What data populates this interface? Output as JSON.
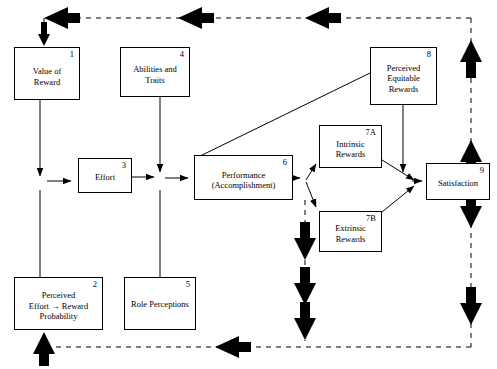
{
  "diagram": {
    "type": "flow-diagram",
    "width": 497,
    "height": 369,
    "line_color": "#000000",
    "background": "#ffffff",
    "boxes": [
      {
        "id": "1",
        "number": "1",
        "label": "Value of\nReward",
        "line1": "Value of",
        "line2": "Reward",
        "line3": "",
        "x": 14,
        "y": 47,
        "w": 66,
        "h": 53
      },
      {
        "id": "4",
        "number": "4",
        "label": "Abilities and\nTraits",
        "line1": "Abilities and",
        "line2": "Traits",
        "line3": "",
        "x": 120,
        "y": 47,
        "w": 70,
        "h": 50
      },
      {
        "id": "8",
        "number": "8",
        "label": "Perceived\nEquitable\nRewards",
        "line1": "Perceived",
        "line2": "Equitable",
        "line3": "Rewards",
        "x": 370,
        "y": 47,
        "w": 67,
        "h": 58
      },
      {
        "id": "3",
        "number": "3",
        "label": "Effort",
        "line1": "Effort",
        "line2": "",
        "line3": "",
        "x": 78,
        "y": 158,
        "w": 54,
        "h": 35
      },
      {
        "id": "6",
        "number": "6",
        "label": "Performance\n(Accomplishment)",
        "line1": "Performance",
        "line2": "(Accomplishment)",
        "line3": "",
        "x": 194,
        "y": 155,
        "w": 99,
        "h": 45
      },
      {
        "id": "7A",
        "number": "7A",
        "label": "Intrinsic\nRewards",
        "line1": "Intrinsic",
        "line2": "Rewards",
        "line3": "",
        "x": 319,
        "y": 125,
        "w": 63,
        "h": 43
      },
      {
        "id": "7B",
        "number": "7B",
        "label": "Extrinsic\nRewards",
        "line1": "Extrinsic",
        "line2": "Rewards",
        "line3": "",
        "x": 319,
        "y": 211,
        "w": 63,
        "h": 41
      },
      {
        "id": "9",
        "number": "9",
        "label": "Satisfaction",
        "line1": "Satisfaction",
        "line2": "",
        "line3": "",
        "x": 426,
        "y": 163,
        "w": 64,
        "h": 37
      },
      {
        "id": "2",
        "number": "2",
        "label": "Perceived\nEffort → Reward\nProbability",
        "line1": "Perceived",
        "line2": "Effort → Reward",
        "line3": "Probability",
        "x": 14,
        "y": 277,
        "w": 89,
        "h": 53
      },
      {
        "id": "5",
        "number": "5",
        "label": "Role Perceptions",
        "line1": "Role Perceptions",
        "line2": "",
        "line3": "",
        "x": 124,
        "y": 277,
        "w": 72,
        "h": 53
      }
    ],
    "connections": [
      {
        "from": "1",
        "to": "3",
        "style": "solid",
        "desc": "value-of-reward-to-effort"
      },
      {
        "from": "2",
        "to": "3",
        "style": "solid",
        "desc": "perceived-probability-to-effort"
      },
      {
        "from": "3",
        "to": "6",
        "style": "solid",
        "desc": "effort-to-performance"
      },
      {
        "from": "4",
        "to": "6",
        "style": "solid",
        "desc": "abilities-to-performance"
      },
      {
        "from": "5",
        "to": "6",
        "style": "solid",
        "desc": "role-perceptions-to-performance"
      },
      {
        "from": "6",
        "to": "7A",
        "style": "solid",
        "desc": "performance-to-intrinsic-rewards"
      },
      {
        "from": "6",
        "to": "7B",
        "style": "solid",
        "desc": "performance-to-extrinsic-rewards"
      },
      {
        "from": "7A",
        "to": "9",
        "style": "solid",
        "desc": "intrinsic-rewards-to-satisfaction"
      },
      {
        "from": "7B",
        "to": "9",
        "style": "solid",
        "desc": "extrinsic-rewards-to-satisfaction"
      },
      {
        "from": "8",
        "to": "9",
        "style": "solid",
        "desc": "perceived-equitable-rewards-to-satisfaction"
      },
      {
        "from": "8",
        "to": "6",
        "style": "solid-plain",
        "desc": "equitable-rewards-performance-link"
      },
      {
        "from": "9",
        "to": "1",
        "style": "dashed",
        "desc": "satisfaction-feedback-to-value-of-reward"
      },
      {
        "from": "6",
        "to": "2",
        "style": "dashed",
        "desc": "performance-feedback-to-perceived-probability"
      }
    ]
  }
}
